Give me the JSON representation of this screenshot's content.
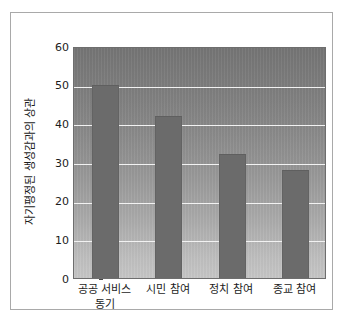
{
  "chart_data": {
    "type": "bar",
    "title": "",
    "subtitle": "",
    "xlabel": "",
    "ylabel": "자기평정된 생성감과의 상관",
    "categories": [
      "공공 서비스 동기",
      "시민 참여",
      "정치 참여",
      "종교 참여"
    ],
    "category_lines": [
      [
        "공공 서비스",
        "동기"
      ],
      [
        "시민 참여"
      ],
      [
        "정치 참여"
      ],
      [
        "종교 참여"
      ]
    ],
    "values": [
      50,
      42,
      32,
      28
    ],
    "ylim": [
      0,
      60
    ],
    "yticks": [
      0,
      10,
      20,
      30,
      40,
      50,
      60
    ],
    "ytick_labels": [
      "0",
      "10",
      "20",
      "30",
      "40",
      "50",
      "60"
    ],
    "grid": true,
    "grid_axis": "y",
    "legend": false,
    "legend_position": "none",
    "series": [
      {
        "name": "자기평정된 생성감과의 상관",
        "values": [
          50,
          42,
          32,
          28
        ],
        "color": "#6b6b6b"
      }
    ],
    "colors": {
      "bar": "#6b6b6b",
      "plot_background_top": "#747474",
      "plot_background_bottom": "#c6c6c6",
      "gridline": "#f2f2f2",
      "axis": "#6e6e6e",
      "text": "#1c1c1c",
      "figure_border": "#a9a9a9",
      "figure_background": "#ffffff"
    }
  }
}
